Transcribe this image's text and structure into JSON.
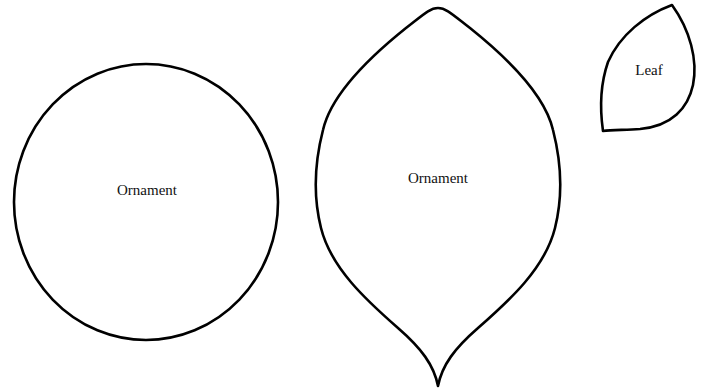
{
  "template": {
    "shapes": [
      {
        "id": "circle-ornament",
        "kind": "circle",
        "label": "Ornament",
        "center": [
          146,
          202
        ],
        "rx": 132,
        "ry": 138,
        "label_pos": [
          147,
          190
        ]
      },
      {
        "id": "teardrop-ornament",
        "kind": "pointed-teardrop",
        "label": "Ornament",
        "top": [
          438,
          8
        ],
        "bottom": [
          438,
          386
        ],
        "left_extent": 314,
        "right_extent": 559,
        "label_pos": [
          438,
          178
        ]
      },
      {
        "id": "leaf",
        "kind": "leaf",
        "label": "Leaf",
        "tip": [
          672,
          5
        ],
        "corner": [
          603,
          131
        ],
        "label_pos": [
          649,
          70
        ]
      }
    ],
    "colors": {
      "stroke": "#000000",
      "fill": "#ffffff",
      "text": "#111111"
    }
  }
}
